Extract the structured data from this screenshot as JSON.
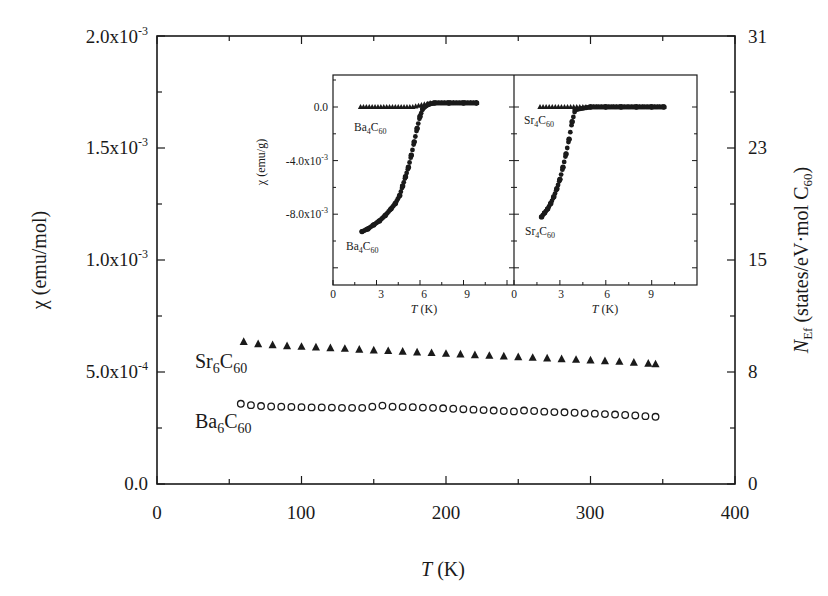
{
  "chart_data": [
    {
      "type": "scatter",
      "title": "",
      "xlabel": "T (K)",
      "ylabel": "χ (emu/mol)",
      "y2label": "N_Ef (states/eV·mol C60)",
      "xlim": [
        0,
        400
      ],
      "ylim": [
        0.0,
        0.002
      ],
      "y2lim": [
        0,
        31
      ],
      "grid": false,
      "x_ticks": [
        "0",
        "100",
        "200",
        "300",
        "400"
      ],
      "y_ticks": [
        "0.0",
        "5.0x10-4",
        "1.0x10-3",
        "1.5x10-3",
        "2.0x10-3"
      ],
      "y2_ticks": [
        "0",
        "8",
        "15",
        "23",
        "31"
      ],
      "legend_position": "inline labels left of series",
      "series": [
        {
          "name": "Sr6C60",
          "marker": "filled-triangle",
          "x": [
            60,
            70,
            80,
            90,
            100,
            110,
            120,
            130,
            140,
            150,
            160,
            170,
            180,
            190,
            200,
            210,
            220,
            230,
            240,
            250,
            260,
            270,
            280,
            290,
            300,
            310,
            320,
            330,
            340,
            345
          ],
          "values": [
            0.000635,
            0.000625,
            0.00062,
            0.000616,
            0.000613,
            0.00061,
            0.000607,
            0.000604,
            0.0006,
            0.000597,
            0.000594,
            0.000591,
            0.000588,
            0.000585,
            0.000582,
            0.000579,
            0.000576,
            0.000573,
            0.00057,
            0.000567,
            0.000564,
            0.000561,
            0.000558,
            0.000555,
            0.000552,
            0.000549,
            0.000546,
            0.000542,
            0.000538,
            0.000535
          ]
        },
        {
          "name": "Ba6C60",
          "marker": "open-circle",
          "x": [
            58,
            65,
            72,
            79,
            86,
            93,
            100,
            107,
            114,
            121,
            128,
            135,
            142,
            149,
            156,
            163,
            170,
            177,
            184,
            191,
            198,
            205,
            212,
            219,
            226,
            233,
            240,
            247,
            254,
            261,
            268,
            275,
            282,
            289,
            296,
            303,
            310,
            317,
            324,
            331,
            338,
            345
          ],
          "values": [
            0.000358,
            0.000352,
            0.000348,
            0.000346,
            0.000345,
            0.000344,
            0.000343,
            0.000342,
            0.000342,
            0.000341,
            0.00034,
            0.00034,
            0.00034,
            0.000345,
            0.00035,
            0.000345,
            0.000344,
            0.000343,
            0.000341,
            0.00034,
            0.000338,
            0.000336,
            0.000334,
            0.000332,
            0.00033,
            0.000328,
            0.000326,
            0.000324,
            0.000328,
            0.000326,
            0.000323,
            0.000321,
            0.00032,
            0.000318,
            0.000316,
            0.000314,
            0.000312,
            0.00031,
            0.000308,
            0.000306,
            0.000303,
            0.0003
          ]
        }
      ],
      "annotations": [
        "Sr6C60",
        "Ba6C60"
      ]
    },
    {
      "type": "scatter",
      "title": "inset-left",
      "xlabel": "T (K)",
      "ylabel": "χ (emu/g)",
      "xlim": [
        0,
        12
      ],
      "ylim": [
        -0.0105,
        0.0025
      ],
      "x_ticks": [
        "0",
        "3",
        "6",
        "9"
      ],
      "y_ticks": [
        "-8.0x10-3",
        "-4.0x10-3",
        "0.0"
      ],
      "series": [
        {
          "name": "Ba4C60 (triangles)",
          "marker": "filled-triangle",
          "x": [
            1.9,
            2.3,
            2.7,
            3.1,
            3.5,
            3.9,
            4.3,
            4.7,
            5.1,
            5.5,
            5.9,
            6.3,
            6.7,
            7.1,
            7.5,
            7.9,
            8.3,
            8.7,
            9.1,
            9.5,
            9.9
          ],
          "values": [
            0.0,
            0.0,
            0.0,
            0.0,
            0.0,
            0.0,
            0.0,
            0.0,
            0.0,
            0.0,
            0.0001,
            0.0002,
            0.0003,
            0.0003,
            0.0003,
            0.0003,
            0.0003,
            0.0003,
            0.0003,
            0.0003,
            0.0003
          ]
        },
        {
          "name": "Ba4C60 (circles)",
          "marker": "filled-circle",
          "x": [
            2.0,
            2.4,
            2.8,
            3.2,
            3.6,
            4.0,
            4.3,
            4.6,
            4.8,
            5.0,
            5.2,
            5.4,
            5.6,
            5.8,
            6.0,
            6.2,
            6.6,
            7.0,
            8.0,
            9.0,
            9.9
          ],
          "values": [
            -0.0093,
            -0.0091,
            -0.0088,
            -0.0085,
            -0.0081,
            -0.0076,
            -0.0072,
            -0.0066,
            -0.0059,
            -0.0052,
            -0.0045,
            -0.0036,
            -0.0026,
            -0.0016,
            -0.0007,
            -0.0001,
            0.0002,
            0.0003,
            0.0003,
            0.0003,
            0.0003
          ]
        }
      ],
      "annotations": [
        "Ba4C60",
        "Ba4C60"
      ]
    },
    {
      "type": "scatter",
      "title": "inset-right",
      "xlabel": "T (K)",
      "ylabel": "",
      "xlim": [
        0,
        12
      ],
      "ylim": [
        -0.0105,
        0.0025
      ],
      "x_ticks": [
        "0",
        "3",
        "6",
        "9"
      ],
      "series": [
        {
          "name": "Sr4C60 (triangles)",
          "marker": "filled-triangle",
          "x": [
            1.7,
            2.1,
            2.5,
            2.9,
            3.3,
            3.7,
            4.1,
            4.5,
            5.0,
            5.5,
            6.0,
            6.5,
            7.0,
            7.5,
            8.0,
            8.5,
            9.0,
            9.5,
            9.8
          ],
          "values": [
            0.0,
            0.0,
            0.0,
            0.0,
            0.0,
            0.0,
            0.0,
            0.0,
            0.0,
            0.0,
            0.0,
            0.0,
            0.0,
            0.0,
            0.0,
            0.0,
            0.0,
            0.0,
            0.0
          ]
        },
        {
          "name": "Sr4C60 (circles)",
          "marker": "filled-circle",
          "x": [
            1.8,
            2.0,
            2.2,
            2.4,
            2.6,
            2.8,
            3.0,
            3.2,
            3.4,
            3.6,
            3.8,
            4.0,
            5.0,
            6.0,
            7.0,
            8.0,
            9.0,
            9.8
          ],
          "values": [
            -0.0082,
            -0.0079,
            -0.0076,
            -0.0072,
            -0.0067,
            -0.0061,
            -0.0054,
            -0.0045,
            -0.0035,
            -0.0024,
            -0.0011,
            -0.0002,
            0.0,
            0.0,
            0.0,
            0.0,
            0.0,
            0.0
          ]
        }
      ],
      "annotations": [
        "Sr4C60",
        "Sr4C60"
      ]
    }
  ],
  "main": {
    "x_ticks": [
      "0",
      "100",
      "200",
      "300",
      "400"
    ],
    "y_ticks": [
      {
        "base": "0.0",
        "exp": ""
      },
      {
        "base": "5.0x10",
        "exp": "-4"
      },
      {
        "base": "1.0x10",
        "exp": "-3"
      },
      {
        "base": "1.5x10",
        "exp": "-3"
      },
      {
        "base": "2.0x10",
        "exp": "-3"
      }
    ],
    "y2_ticks": [
      "0",
      "8",
      "15",
      "23",
      "31"
    ],
    "xlabel_italic": "T",
    "xlabel_unit": " (K)",
    "ylabel": "χ (emu/mol)",
    "y2label_italic": "N",
    "y2label_sub": "Ef",
    "y2label_rest": " (states/eV·mol C",
    "y2label_sub2": "60",
    "y2label_end": ")",
    "labels": {
      "sr_main": "Sr",
      "sr_sub": "6",
      "sr_c": "C",
      "sr_sub2": "60",
      "ba_main": "Ba",
      "ba_sub": "6",
      "ba_c": "C",
      "ba_sub2": "60"
    }
  },
  "inset": {
    "left_x_ticks": [
      "0",
      "3",
      "6",
      "9"
    ],
    "right_x_ticks": [
      "0",
      "3",
      "6",
      "9"
    ],
    "y_ticks": [
      {
        "base": "0.0",
        "exp": ""
      },
      {
        "base": "-4.0x10",
        "exp": "-3"
      },
      {
        "base": "-8.0x10",
        "exp": "-3"
      }
    ],
    "ylabel": "χ (emu/g)",
    "xlabel_italic": "T",
    "xlabel_unit": " (K)",
    "labels": {
      "ba_top": "Ba",
      "ba_top_sub": "4",
      "ba_top_c": "C",
      "ba_top_sub2": "60",
      "ba_bot": "Ba",
      "ba_bot_sub": "4",
      "ba_bot_c": "C",
      "ba_bot_sub2": "60",
      "sr_top": "Sr",
      "sr_top_sub": "4",
      "sr_top_c": "C",
      "sr_top_sub2": "60",
      "sr_bot": "Sr",
      "sr_bot_sub": "4",
      "sr_bot_c": "C",
      "sr_bot_sub2": "60"
    }
  },
  "colors": {
    "ink": "#1a1a1a",
    "background": "#ffffff"
  }
}
